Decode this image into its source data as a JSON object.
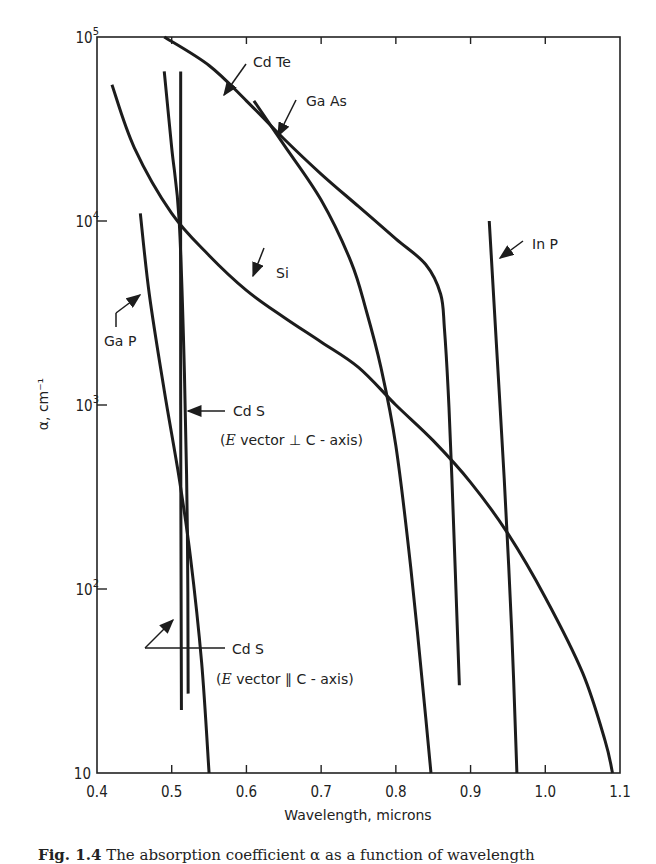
{
  "chart_data": {
    "type": "line",
    "title": "",
    "xlabel": "Wavelength, microns",
    "ylabel": "α, cm⁻¹",
    "xlim": [
      0.4,
      1.1
    ],
    "ylim": [
      10,
      100000
    ],
    "yscale": "log",
    "grid": false,
    "legend": "none (inline annotations)",
    "x_ticks": [
      0.4,
      0.5,
      0.6,
      0.7,
      0.8,
      0.9,
      1.0,
      1.1
    ],
    "x_tick_labels": [
      "0.4",
      "0.5",
      "0.6",
      "0.7",
      "0.8",
      "0.9",
      "1.0",
      "1.1"
    ],
    "y_ticks": [
      10,
      100,
      1000,
      10000,
      100000
    ],
    "y_tick_labels": [
      "10",
      "10²",
      "10³",
      "10⁴",
      "10⁵"
    ],
    "series": [
      {
        "name": "Cd Te",
        "x": [
          0.49,
          0.55,
          0.6,
          0.65,
          0.7,
          0.75,
          0.8,
          0.84,
          0.86,
          0.865,
          0.87,
          0.875,
          0.885
        ],
        "y": [
          100000,
          70000,
          45000,
          28000,
          18000,
          12000,
          8000,
          5800,
          4000,
          2600,
          1200,
          400,
          30
        ]
      },
      {
        "name": "Ga As",
        "x": [
          0.61,
          0.65,
          0.7,
          0.74,
          0.76,
          0.78,
          0.8,
          0.82,
          0.84,
          0.847
        ],
        "y": [
          45000,
          26000,
          13000,
          6000,
          3300,
          1600,
          600,
          130,
          20,
          10
        ]
      },
      {
        "name": "Si",
        "x": [
          0.42,
          0.45,
          0.5,
          0.55,
          0.6,
          0.65,
          0.7,
          0.75,
          0.8,
          0.85,
          0.9,
          0.95,
          1.0,
          1.05,
          1.08,
          1.09
        ],
        "y": [
          55000,
          25000,
          11000,
          6500,
          4200,
          3000,
          2200,
          1600,
          1000,
          640,
          380,
          200,
          90,
          35,
          15,
          10
        ]
      },
      {
        "name": "In P",
        "x": [
          0.925,
          0.935,
          0.945,
          0.955,
          0.962
        ],
        "y": [
          10000,
          2000,
          400,
          60,
          10
        ]
      },
      {
        "name": "Ga P",
        "x": [
          0.458,
          0.47,
          0.49,
          0.51,
          0.525,
          0.54,
          0.55
        ],
        "y": [
          11000,
          4000,
          1200,
          400,
          150,
          40,
          10
        ]
      },
      {
        "name": "Cd S (E vector ⊥ C-axis)",
        "x": [
          0.512,
          0.512,
          0.513
        ],
        "y": [
          65000,
          1000,
          22
        ]
      },
      {
        "name": "Cd S (E vector ∥ C-axis)",
        "x": [
          0.49,
          0.5,
          0.51,
          0.517,
          0.521,
          0.522
        ],
        "y": [
          65000,
          25000,
          10000,
          1500,
          200,
          27
        ]
      }
    ],
    "annotations": [
      {
        "text": "Cd Te",
        "x": 0.62,
        "y": 80000
      },
      {
        "text": "Ga As",
        "x": 0.665,
        "y": 55000
      },
      {
        "text": "Si",
        "x": 0.64,
        "y": 7500
      },
      {
        "text": "In P",
        "x": 0.96,
        "y": 8000
      },
      {
        "text": "Ga P",
        "x": 0.43,
        "y": 2000
      },
      {
        "text": "Cd S",
        "x": 0.56,
        "y": 950
      },
      {
        "text": "(E vector ⊥ C - axis)",
        "x": 0.56,
        "y": 600
      },
      {
        "text": "Cd S",
        "x": 0.56,
        "y": 48
      },
      {
        "text": "(E vector ∥ C - axis)",
        "x": 0.56,
        "y": 30
      }
    ]
  },
  "labels": {
    "cdte": "Cd Te",
    "gaas": "Ga As",
    "si": "Si",
    "inp": "In P",
    "gap": "Ga P",
    "cds1": "Cd S",
    "cds1_note_pre": "(",
    "cds1_note_e": "E",
    "cds1_note_post": " vector ⊥ C - axis)",
    "cds2": "Cd S",
    "cds2_note_pre": "(",
    "cds2_note_e": "E",
    "cds2_note_post": " vector ∥ C - axis)"
  },
  "caption": {
    "fig": "Fig. 1.4",
    "text": "   The absorption coefficient α as a function of wavelength"
  }
}
